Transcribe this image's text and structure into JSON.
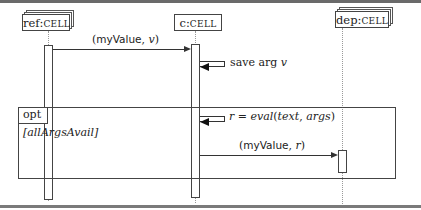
{
  "diagram": {
    "type": "sequence",
    "participants": [
      {
        "id": "ref",
        "name": "ref",
        "class": "Cell",
        "stacked": true
      },
      {
        "id": "c",
        "name": "c",
        "class": "Cell",
        "stacked": false
      },
      {
        "id": "dep",
        "name": "dep",
        "class": "Cell",
        "stacked": true
      }
    ],
    "labels": {
      "ref_name": "ref:",
      "ref_class": "CELL",
      "c_name": "c:",
      "c_class": "CELL",
      "dep_name": "dep:",
      "dep_class": "CELL"
    },
    "messages": [
      {
        "from": "ref",
        "to": "c",
        "label_fn": "myValue",
        "label_arg": "v"
      },
      {
        "from": "c",
        "to": "c",
        "label": "save arg",
        "label_arg": "v"
      },
      {
        "from": "c",
        "to": "c",
        "label": "r = eval(text, args)"
      },
      {
        "from": "c",
        "to": "dep",
        "label_fn": "myValue",
        "label_arg": "r"
      }
    ],
    "m1": {
      "open": "(",
      "fn": "myValue",
      "sep": ", ",
      "arg": "v",
      "close": ")"
    },
    "m2": {
      "text": "save arg ",
      "arg": "v"
    },
    "m3": {
      "lhs": "r",
      "eq": " = ",
      "fn": "eval",
      "open": "(",
      "a1": "text",
      "sep": ", ",
      "a2": "args",
      "close": ")"
    },
    "m4": {
      "open": "(",
      "fn": "myValue",
      "sep": ", ",
      "arg": "r",
      "close": ")"
    },
    "fragment": {
      "operator": "opt",
      "guard": "[allArgsAvail]"
    }
  }
}
